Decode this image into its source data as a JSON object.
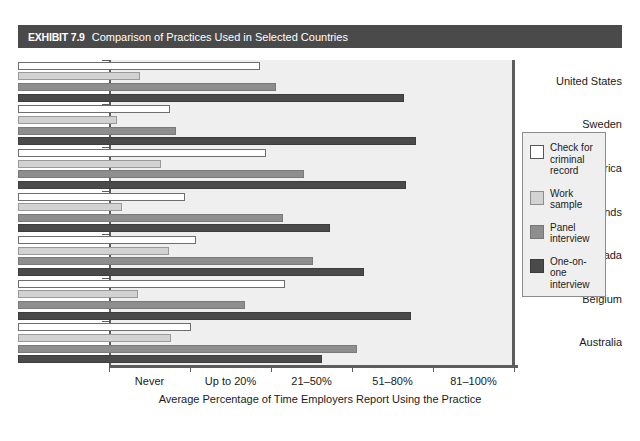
{
  "exhibit": {
    "number": "EXHIBIT 7.9",
    "caption": "Comparison of Practices Used in Selected Countries"
  },
  "chart_data": {
    "type": "bar",
    "orientation": "horizontal",
    "title": "Comparison of Practices Used in Selected Countries",
    "xlabel": "Average Percentage of Time Employers Report Using the Practice",
    "ylabel": "",
    "grid": false,
    "legend_position": "right",
    "xticklabels": [
      "Never",
      "Up to 20%",
      "21–50%",
      "51–80%",
      "81–100%"
    ],
    "xlim": [
      0,
      100
    ],
    "categories": [
      "United States",
      "Sweden",
      "South Africa",
      "Netherlands",
      "Canada",
      "Belgium",
      "Australia"
    ],
    "series": [
      {
        "name": "Check for criminal record",
        "color": "#ffffff",
        "values": [
          59.8,
          37.5,
          61.2,
          41.2,
          43.9,
          65.9,
          42.7
        ]
      },
      {
        "name": "Work sample",
        "color": "#d2d2d2",
        "values": [
          30.1,
          24.4,
          35.3,
          25.7,
          37.3,
          29.6,
          37.8
        ]
      },
      {
        "name": "Panel interview",
        "color": "#8e8e8e",
        "values": [
          63.7,
          39.0,
          70.6,
          65.4,
          72.8,
          56.0,
          83.7
        ]
      },
      {
        "name": "One-on-one interview",
        "color": "#4a4a4a",
        "values": [
          95.3,
          98.2,
          95.8,
          77.0,
          85.4,
          97.0,
          75.1
        ]
      }
    ]
  },
  "legend": {
    "items": [
      {
        "label": "Check for criminal record"
      },
      {
        "label": "Work sample"
      },
      {
        "label": "Panel interview"
      },
      {
        "label": "One-on-one interview"
      }
    ]
  }
}
